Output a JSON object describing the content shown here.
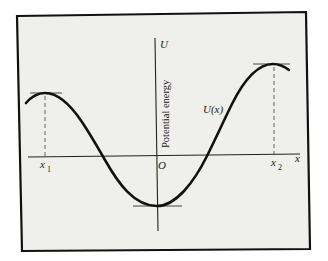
{
  "figure": {
    "frame_background": "#efefeb",
    "frame_stroke": "#111111",
    "curve_color": "#111111",
    "axis_color": "#222222"
  },
  "labels": {
    "y_axis_symbol": "U",
    "y_axis_title": "Potential energy",
    "x_axis_symbol": "x",
    "origin": "O",
    "curve_label": "U(x)",
    "x1_base": "x",
    "x1_sub": "1",
    "x2_base": "x",
    "x2_sub": "2"
  },
  "annotations": {
    "local_max_left": "x1",
    "local_max_right": "x2",
    "local_min": "O"
  }
}
